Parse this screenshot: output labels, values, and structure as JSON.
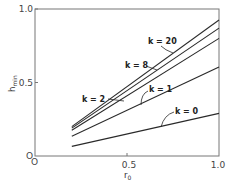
{
  "chart_data": {
    "type": "line",
    "title": "",
    "xlabel": "r0",
    "ylabel": "hmin",
    "xlim": [
      0,
      1.0
    ],
    "ylim": [
      0,
      1.0
    ],
    "grid": false,
    "legend": "inline labels with leader arrows",
    "xticks": [
      "0",
      "0.5",
      "1.0"
    ],
    "yticks": [
      "0",
      "0.5",
      "1.0"
    ],
    "origin_labels": [
      "O",
      "O"
    ],
    "series": [
      {
        "name": "k = 20",
        "x": [
          0.2,
          1.0
        ],
        "y": [
          0.2,
          0.925
        ]
      },
      {
        "name": "k = 8",
        "x": [
          0.2,
          1.0
        ],
        "y": [
          0.19,
          0.87
        ]
      },
      {
        "name": "k = 2",
        "x": [
          0.2,
          1.0
        ],
        "y": [
          0.175,
          0.8
        ]
      },
      {
        "name": "k = 1",
        "x": [
          0.2,
          1.0
        ],
        "y": [
          0.135,
          0.605
        ]
      },
      {
        "name": "k = 0",
        "x": [
          0.2,
          1.0
        ],
        "y": [
          0.065,
          0.29
        ]
      }
    ]
  },
  "labels": {
    "y_tick_top": "1.0",
    "y_tick_mid": "0.5",
    "x_tick_mid": "0.5",
    "x_tick_right": "1.0",
    "origin_y": "O",
    "origin_x": "O",
    "ylabel_main": "h",
    "ylabel_sub": "min",
    "xlabel_main": "r",
    "xlabel_sub": "0",
    "k20": "k = 20",
    "k8": "k = 8",
    "k2": "k = 2",
    "k1": "k = 1",
    "k0": "k = 0"
  },
  "colors": {
    "line": "#2a2a2a",
    "axis": "#666666"
  }
}
